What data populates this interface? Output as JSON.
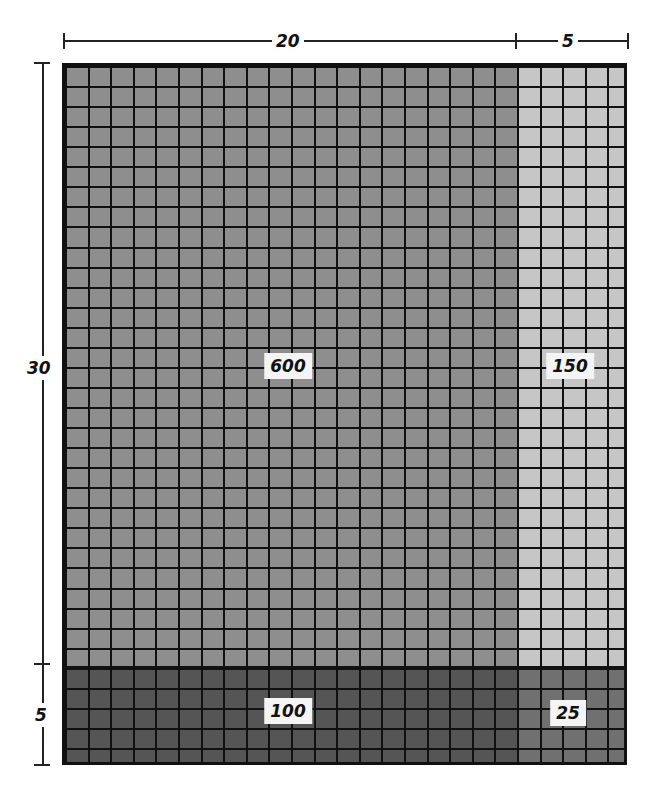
{
  "diagram": {
    "type": "area-model",
    "dimensions": {
      "top": [
        {
          "label": "20"
        },
        {
          "label": "5"
        }
      ],
      "left": [
        {
          "label": "30"
        },
        {
          "label": "5"
        }
      ]
    },
    "regions": [
      {
        "id": "tl",
        "value": "600",
        "cols": 20,
        "rows": 30,
        "color": "#8e8e8e"
      },
      {
        "id": "tr",
        "value": "150",
        "cols": 5,
        "rows": 30,
        "color": "#c4c4c4"
      },
      {
        "id": "bl",
        "value": "100",
        "cols": 20,
        "rows": 5,
        "color": "#555555"
      },
      {
        "id": "br",
        "value": "25",
        "cols": 5,
        "rows": 5,
        "color": "#6e6e6e"
      }
    ],
    "grid": {
      "cols": 25,
      "rows": 35,
      "line_color": "#111111"
    }
  }
}
